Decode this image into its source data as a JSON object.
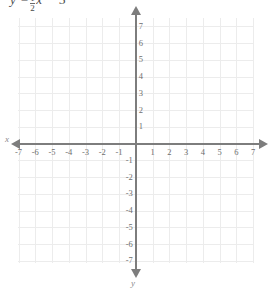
{
  "title": {
    "prefix": "y =",
    "fraction": {
      "numerator": "1",
      "denominator": "2"
    },
    "suffix": "x − 5",
    "full": "y = 1/2 x − 5"
  },
  "axes": {
    "x_label": "x",
    "y_label": "y",
    "x_ticks": [
      "-7",
      "-6",
      "-5",
      "-4",
      "-3",
      "-2",
      "-1",
      "1",
      "2",
      "3",
      "4",
      "5",
      "6",
      "7"
    ],
    "y_ticks_positive": [
      "1",
      "2",
      "3",
      "4",
      "5",
      "6",
      "7"
    ],
    "y_ticks_negative": [
      "-1",
      "-2",
      "-3",
      "-4",
      "-5",
      "-6",
      "-7"
    ]
  },
  "chart_data": {
    "type": "line",
    "xlabel": "x",
    "ylabel": "y",
    "xlim": [
      -7,
      7
    ],
    "ylim": [
      -7,
      7
    ],
    "x_tick_step": 1,
    "y_tick_step": 1,
    "grid": true,
    "legend": "none",
    "series": [],
    "annotations": [
      "Blank coordinate plane; no line is plotted."
    ],
    "colors": {
      "grid": "#ececec",
      "axis": "#7d7d7d",
      "tick_text": "#6e6e6e",
      "title_text": "#4a4a4a",
      "background": "#ffffff"
    }
  }
}
